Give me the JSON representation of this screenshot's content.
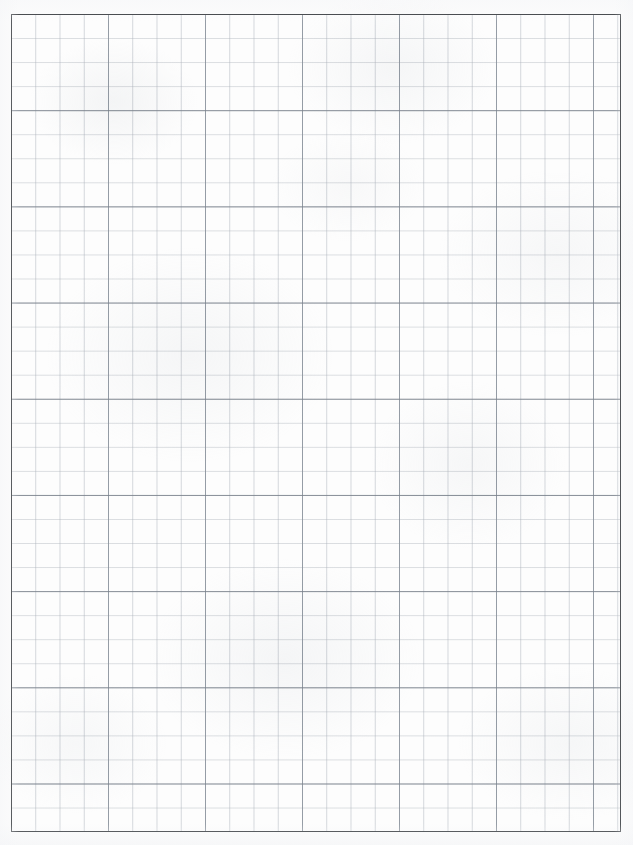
{
  "page": {
    "kind": "graph-paper-scan",
    "width_px": 633,
    "height_px": 845,
    "background_color": "#fdfdfd",
    "paper_tint": "#fcfcfc"
  },
  "border": {
    "name": "ruled-rectangle",
    "color": "#2e3236",
    "thickness_px": 1.6,
    "left_px": 11,
    "top_px": 14,
    "width_px": 610,
    "height_px": 818
  },
  "grid": {
    "minor": {
      "label": "minor-grid",
      "spacing_x_px": 24.25,
      "spacing_y_px": 24.05,
      "color": "#b0b6be",
      "line_width_px": 1,
      "columns": 25,
      "rows": 34
    },
    "major": {
      "label": "major-grid",
      "spacing_x_px": 97.0,
      "spacing_y_px": 96.2,
      "color_horizontal": "#788089",
      "color_vertical": "#868e98",
      "line_width_px": 1,
      "squares_per_major": 4,
      "columns": 7,
      "rows": 9
    }
  },
  "texture": {
    "label": "scanned-paper-mottling",
    "tone_color": "#d0d4d8",
    "opacity": 0.18
  },
  "chart_data": {
    "type": "table",
    "title": "",
    "xlabel": "",
    "ylabel": "",
    "categories": [],
    "values": [],
    "note": "Blank graph paper — no plotted data, labels, ticks, or legend present."
  }
}
